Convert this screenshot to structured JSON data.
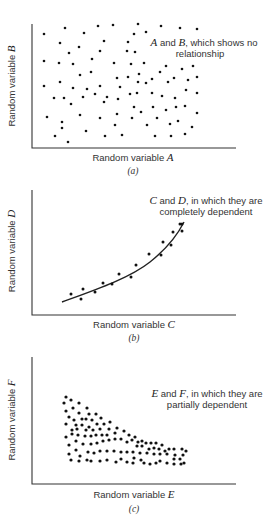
{
  "chart_data": [
    {
      "type": "scatter",
      "panel": "(a)",
      "xlabel": "Random variable A",
      "ylabel": "Random variable B",
      "annotation": [
        "A and B, which shows no",
        "relationship"
      ],
      "caption": "(a)",
      "grid": false,
      "axes": {
        "x0": 32,
        "y0": 148,
        "x1": 236,
        "ytop": 24
      },
      "dot_radius": 1.3,
      "points": [
        [
          44,
          34
        ],
        [
          65,
          28
        ],
        [
          84,
          33
        ],
        [
          98,
          26
        ],
        [
          113,
          25
        ],
        [
          138,
          24
        ],
        [
          134,
          34
        ],
        [
          146,
          32
        ],
        [
          161,
          26
        ],
        [
          180,
          28
        ],
        [
          197,
          29
        ],
        [
          60,
          43
        ],
        [
          79,
          47
        ],
        [
          69,
          53
        ],
        [
          104,
          41
        ],
        [
          100,
          51
        ],
        [
          128,
          42
        ],
        [
          127,
          51
        ],
        [
          135,
          52
        ],
        [
          44,
          61
        ],
        [
          59,
          63
        ],
        [
          73,
          64
        ],
        [
          92,
          59
        ],
        [
          114,
          63
        ],
        [
          131,
          64
        ],
        [
          144,
          63
        ],
        [
          166,
          66
        ],
        [
          182,
          69
        ],
        [
          193,
          66
        ],
        [
          80,
          75
        ],
        [
          91,
          72
        ],
        [
          117,
          78
        ],
        [
          128,
          77
        ],
        [
          139,
          74
        ],
        [
          160,
          72
        ],
        [
          174,
          78
        ],
        [
          197,
          77
        ],
        [
          44,
          86
        ],
        [
          60,
          82
        ],
        [
          73,
          88
        ],
        [
          87,
          89
        ],
        [
          100,
          86
        ],
        [
          120,
          87
        ],
        [
          138,
          82
        ],
        [
          146,
          83
        ],
        [
          152,
          79
        ],
        [
          168,
          82
        ],
        [
          188,
          80
        ],
        [
          54,
          98
        ],
        [
          64,
          98
        ],
        [
          83,
          97
        ],
        [
          95,
          94
        ],
        [
          107,
          97
        ],
        [
          130,
          94
        ],
        [
          137,
          93
        ],
        [
          152,
          93
        ],
        [
          162,
          96
        ],
        [
          175,
          98
        ],
        [
          186,
          90
        ],
        [
          197,
          93
        ],
        [
          71,
          104
        ],
        [
          104,
          102
        ],
        [
          118,
          99
        ],
        [
          134,
          107
        ],
        [
          153,
          107
        ],
        [
          166,
          110
        ],
        [
          176,
          107
        ],
        [
          185,
          106
        ],
        [
          47,
          117
        ],
        [
          80,
          115
        ],
        [
          100,
          118
        ],
        [
          117,
          114
        ],
        [
          132,
          118
        ],
        [
          141,
          112
        ],
        [
          157,
          118
        ],
        [
          178,
          121
        ],
        [
          170,
          124
        ],
        [
          197,
          113
        ],
        [
          62,
          122
        ],
        [
          62,
          128
        ],
        [
          115,
          125
        ],
        [
          147,
          125
        ],
        [
          192,
          127
        ],
        [
          86,
          131
        ],
        [
          55,
          136
        ],
        [
          68,
          142
        ],
        [
          105,
          136
        ],
        [
          122,
          135
        ],
        [
          155,
          136
        ],
        [
          171,
          136
        ],
        [
          185,
          134
        ]
      ]
    },
    {
      "type": "scatter",
      "panel": "(b)",
      "xlabel": "Random variable C",
      "ylabel": "Random variable D",
      "annotation": [
        "C and D, in which they are",
        "completely dependent"
      ],
      "caption": "(b)",
      "grid": false,
      "fit": "exponential curve",
      "axes": {
        "x0": 32,
        "y0": 315,
        "x1": 236,
        "ytop": 190
      },
      "dot_radius": 1.5,
      "curve_path": "M62,302 C95,290 130,278 150,262 C165,250 176,238 184,222",
      "points": [
        [
          71,
          294
        ],
        [
          81,
          299
        ],
        [
          83,
          289
        ],
        [
          95,
          292
        ],
        [
          103,
          283
        ],
        [
          112,
          284
        ],
        [
          119,
          274
        ],
        [
          131,
          277
        ],
        [
          136,
          265
        ],
        [
          149,
          254
        ],
        [
          161,
          255
        ],
        [
          163,
          242
        ],
        [
          171,
          245
        ],
        [
          173,
          232
        ],
        [
          180,
          224
        ],
        [
          182,
          231
        ],
        [
          182,
          224
        ]
      ]
    },
    {
      "type": "scatter",
      "panel": "(c)",
      "xlabel": "Random variable E",
      "ylabel": "Random variable F",
      "annotation": [
        "E and F, in which they are",
        "partially dependent"
      ],
      "caption": "(c)",
      "grid": false,
      "axes": {
        "x0": 32,
        "y0": 484,
        "x1": 236,
        "ytop": 357
      },
      "dot_radius": 1.6,
      "points": [
        [
          66,
          397
        ],
        [
          71,
          400
        ],
        [
          64,
          403
        ],
        [
          79,
          403
        ],
        [
          73,
          408
        ],
        [
          87,
          408
        ],
        [
          66,
          411
        ],
        [
          79,
          413
        ],
        [
          89,
          414
        ],
        [
          96,
          414
        ],
        [
          69,
          417
        ],
        [
          74,
          420
        ],
        [
          82,
          419
        ],
        [
          86,
          419
        ],
        [
          92,
          420
        ],
        [
          101,
          418
        ],
        [
          66,
          424
        ],
        [
          76,
          425
        ],
        [
          82,
          425
        ],
        [
          89,
          427
        ],
        [
          97,
          424
        ],
        [
          104,
          424
        ],
        [
          110,
          422
        ],
        [
          72,
          430
        ],
        [
          77,
          429
        ],
        [
          86,
          430
        ],
        [
          93,
          430
        ],
        [
          100,
          429
        ],
        [
          109,
          429
        ],
        [
          117,
          428
        ],
        [
          66,
          437
        ],
        [
          72,
          434
        ],
        [
          78,
          435
        ],
        [
          85,
          436
        ],
        [
          91,
          436
        ],
        [
          96,
          435
        ],
        [
          102,
          435
        ],
        [
          107,
          435
        ],
        [
          115,
          433
        ],
        [
          124,
          431
        ],
        [
          121,
          439
        ],
        [
          115,
          439
        ],
        [
          109,
          440
        ],
        [
          103,
          441
        ],
        [
          97,
          443
        ],
        [
          91,
          444
        ],
        [
          83,
          444
        ],
        [
          76,
          441
        ],
        [
          69,
          445
        ],
        [
          129,
          435
        ],
        [
          135,
          437
        ],
        [
          127,
          442
        ],
        [
          132,
          440
        ],
        [
          138,
          442
        ],
        [
          142,
          441
        ],
        [
          146,
          443
        ],
        [
          151,
          443
        ],
        [
          156,
          443
        ],
        [
          162,
          445
        ],
        [
          137,
          446
        ],
        [
          142,
          446
        ],
        [
          149,
          449
        ],
        [
          154,
          448
        ],
        [
          159,
          449
        ],
        [
          165,
          451
        ],
        [
          169,
          449
        ],
        [
          174,
          449
        ],
        [
          182,
          449
        ],
        [
          186,
          451
        ],
        [
          69,
          454
        ],
        [
          76,
          450
        ],
        [
          80,
          456
        ],
        [
          88,
          452
        ],
        [
          94,
          453
        ],
        [
          100,
          451
        ],
        [
          107,
          451
        ],
        [
          114,
          451
        ],
        [
          121,
          452
        ],
        [
          127,
          452
        ],
        [
          133,
          452
        ],
        [
          140,
          453
        ],
        [
          147,
          453
        ],
        [
          154,
          454
        ],
        [
          160,
          454
        ],
        [
          167,
          454
        ],
        [
          175,
          455
        ],
        [
          183,
          455
        ],
        [
          71,
          460
        ],
        [
          79,
          461
        ],
        [
          87,
          460
        ],
        [
          91,
          461
        ],
        [
          100,
          461
        ],
        [
          107,
          460
        ],
        [
          116,
          462
        ],
        [
          121,
          459
        ],
        [
          127,
          462
        ],
        [
          133,
          463
        ],
        [
          134,
          458
        ],
        [
          141,
          460
        ],
        [
          144,
          463
        ],
        [
          150,
          464
        ],
        [
          156,
          463
        ],
        [
          160,
          461
        ],
        [
          167,
          463
        ],
        [
          174,
          464
        ],
        [
          174,
          459
        ],
        [
          181,
          464
        ],
        [
          180,
          459
        ],
        [
          184,
          463
        ]
      ]
    }
  ],
  "panels": {
    "a": {
      "ylabel_prefix": "Random variable ",
      "ylabel_var": "B",
      "xlabel_prefix": "Random variable ",
      "xlabel_var": "A",
      "note1_v1": "A",
      "note1_mid": " and ",
      "note1_v2": "B",
      "note1_rest": ", which shows no",
      "note2": "relationship",
      "caption": "(a)"
    },
    "b": {
      "ylabel_prefix": "Random variable ",
      "ylabel_var": "D",
      "xlabel_prefix": "Random variable ",
      "xlabel_var": "C",
      "note1_v1": "C",
      "note1_mid": " and ",
      "note1_v2": "D",
      "note1_rest": ", in which they are",
      "note2": "completely dependent",
      "caption": "(b)"
    },
    "c": {
      "ylabel_prefix": "Random variable ",
      "ylabel_var": "F",
      "xlabel_prefix": "Random variable ",
      "xlabel_var": "E",
      "note1_v1": "E",
      "note1_mid": " and ",
      "note1_v2": "F",
      "note1_rest": ", in which they are",
      "note2": "partially dependent",
      "caption": "(c)"
    }
  }
}
